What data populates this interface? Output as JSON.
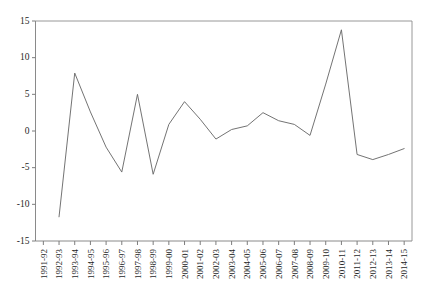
{
  "chart_data": {
    "type": "line",
    "title": "",
    "xlabel": "",
    "ylabel": "",
    "ylim": [
      -15,
      15
    ],
    "yticks": [
      15,
      10,
      5,
      0,
      -5,
      -10,
      -15
    ],
    "grid": false,
    "legend": "none",
    "categories": [
      "1991-92",
      "1992-93",
      "1993-94",
      "1994-95",
      "1995-96",
      "1996-97",
      "1997-98",
      "1998-99",
      "1999-00",
      "2000-01",
      "2001-02",
      "2002-03",
      "2003-04",
      "2004-05",
      "2005-06",
      "2006-07",
      "2007-08",
      "2008-09",
      "2009-10",
      "2010-11",
      "2011-12",
      "2012-13",
      "2013-14",
      "2014-15"
    ],
    "values": [
      null,
      -11.7,
      7.9,
      2.6,
      -2.2,
      -5.6,
      5.0,
      -5.9,
      0.9,
      4.0,
      1.6,
      -1.1,
      0.2,
      0.7,
      2.5,
      1.4,
      0.9,
      -0.6,
      6.4,
      13.8,
      -3.2,
      -3.9,
      -3.2,
      -2.4
    ],
    "series_name": "",
    "line_color": "#6b6b6b"
  }
}
